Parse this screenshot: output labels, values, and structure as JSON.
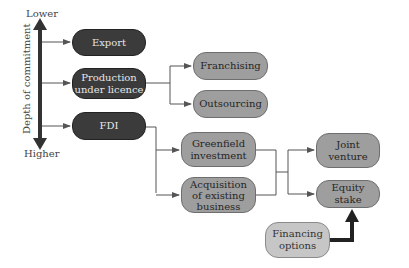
{
  "axis": {
    "title": "Depth of commitment",
    "top_label": "Lower",
    "bottom_label": "Higher"
  },
  "nodes": {
    "export": "Export",
    "production_line1": "Production",
    "production_line2": "under licence",
    "fdi": "FDI",
    "franchising": "Franchising",
    "outsourcing": "Outsourcing",
    "greenfield_line1": "Greenfield",
    "greenfield_line2": "investment",
    "acquisition_line1": "Acquisition",
    "acquisition_line2": "of existing",
    "acquisition_line3": "business",
    "joint_line1": "Joint",
    "joint_line2": "venture",
    "equity": "Equity stake",
    "financing_line1": "Financing",
    "financing_line2": "options"
  },
  "colors": {
    "dark_node": "#3b3b3b",
    "grey_node": "#9e9e9e",
    "light_node": "#c6c6c6",
    "connector": "#555555"
  }
}
